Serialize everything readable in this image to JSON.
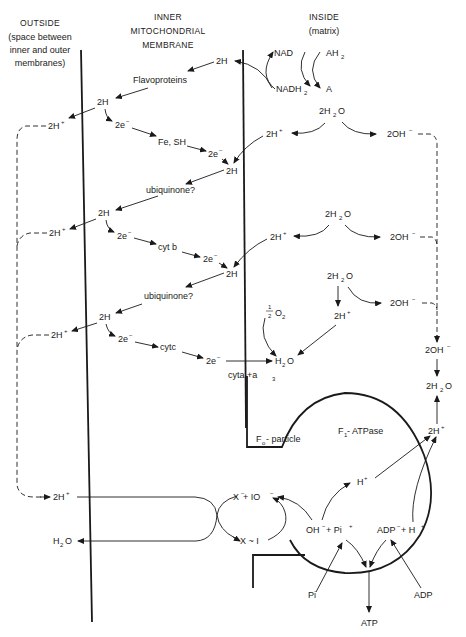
{
  "headers": {
    "outside": [
      "OUTSIDE",
      "(space between",
      "inner and outer",
      "membranes)"
    ],
    "membrane": [
      "INNER",
      "MITOCHONDRIAL",
      "MEMBRANE"
    ],
    "inside": [
      "INSIDE",
      "(matrix)"
    ]
  },
  "labels": {
    "nad": "NAD",
    "ah2": "AH",
    "nadh2": "NADH",
    "a": "A",
    "two_h_top": "2H",
    "flavoproteins": "Flavoproteins",
    "two_h_1": "2H",
    "two_h_plus_out_1": "2H",
    "two_e_1": "2e",
    "fe_sh": "Fe, SH",
    "two_e_2": "2e",
    "two_h_2": "2H",
    "h2o_in_1": "2H",
    "two_h_plus_in_1": "2H",
    "two_oh_1": "2OH",
    "ubiquinone_1": "ubiquinone?",
    "two_h_3": "2H",
    "two_h_plus_out_2": "2H",
    "two_e_3": "2e",
    "cyt_b": "cyt b",
    "two_e_4": "2e",
    "two_h_4": "2H",
    "h2o_in_2": "2H",
    "two_h_plus_in_2": "2H",
    "two_oh_2": "2OH",
    "ubiquinone_2": "ubiquinone?",
    "half_o2": "O",
    "h2o_in_3": "2H",
    "two_h_plus_in_3": "2H",
    "two_oh_3": "2OH",
    "two_h_5": "2H",
    "two_h_plus_out_3": "2H",
    "two_e_5": "2e",
    "cytc": "cytc",
    "two_e_6": "2e",
    "h2o_product": "H",
    "cyta_a3": "cyta  +a",
    "two_oh_4": "2OH",
    "two_h2o": "2H",
    "two_h_plus_right": "2H",
    "f1_atpase": "F",
    "f1_atpase_rest": " - ATPase",
    "fo_particle": "F",
    "fo_particle_rest": " - particle",
    "two_h_plus_out_4": "2H",
    "h2o_out": "H",
    "x_io": "X",
    "x_io_rest": " + IO",
    "x_i": "X ~ I",
    "h_plus": "H",
    "oh_pi": "OH",
    "oh_pi_rest": " + Pi",
    "adp_h": "ADP",
    "adp_h_rest": " + H",
    "pi": "Pi",
    "adp": "ADP",
    "atp": "ATP"
  },
  "glyphs": {
    "plus": "+",
    "minus": "−",
    "sub2": "2",
    "sub3": "3",
    "sub1": "1",
    "subo": "o",
    "o_suffix": "O",
    "half_num": "1",
    "half_den": "2"
  }
}
